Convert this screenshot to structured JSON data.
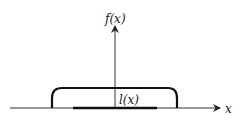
{
  "diagram": {
    "y_axis_label": "f(x)",
    "x_axis_label": "x",
    "segment_label": "l(x)",
    "colors": {
      "ink": "#222222",
      "background": "#ffffff"
    }
  }
}
